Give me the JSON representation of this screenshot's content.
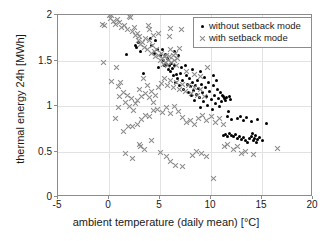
{
  "chart_data": {
    "type": "scatter",
    "title": "",
    "xlabel": "ambient temperature (daily mean) [°C]",
    "ylabel": "thermal energy 24h [MWh]",
    "xlim": [
      -5,
      20
    ],
    "ylim": [
      0,
      2
    ],
    "xticks": [
      -5,
      0,
      5,
      10,
      15,
      20
    ],
    "xticklabels": [
      "-5",
      "0",
      "5",
      "10",
      "15",
      "20"
    ],
    "yticks": [
      0,
      0.5,
      1,
      1.5,
      2
    ],
    "yticklabels": [
      "0",
      "0.5",
      "1",
      "1.5",
      "2"
    ],
    "grid": true,
    "legend_position": "top-right",
    "colors": {
      "without_setback": "#000000",
      "with_setback": "#8a8a8a",
      "axis": "#8c8c8c",
      "grid": "#e2e2e2",
      "background": "#ffffff"
    },
    "series": [
      {
        "name": "without setback mode",
        "marker": "dot",
        "color": "#000000",
        "points": [
          [
            1.7,
            1.57
          ],
          [
            2.6,
            1.66
          ],
          [
            2.7,
            1.64
          ],
          [
            2.9,
            1.7
          ],
          [
            3.1,
            1.6
          ],
          [
            3.4,
            1.36
          ],
          [
            4.2,
            1.67
          ],
          [
            4.5,
            1.58
          ],
          [
            4.8,
            1.62
          ],
          [
            5.0,
            1.55
          ],
          [
            5.2,
            1.62
          ],
          [
            5.3,
            1.5
          ],
          [
            5.5,
            1.57
          ],
          [
            5.6,
            1.46
          ],
          [
            5.7,
            1.52
          ],
          [
            5.8,
            1.4
          ],
          [
            5.9,
            1.44
          ],
          [
            6.0,
            1.38
          ],
          [
            6.1,
            1.47
          ],
          [
            6.2,
            1.41
          ],
          [
            6.3,
            1.33
          ],
          [
            6.4,
            1.44
          ],
          [
            6.5,
            1.26
          ],
          [
            6.6,
            1.35
          ],
          [
            6.7,
            1.3
          ],
          [
            6.9,
            1.22
          ],
          [
            7.0,
            1.36
          ],
          [
            7.2,
            1.28
          ],
          [
            7.3,
            1.18
          ],
          [
            7.5,
            1.45
          ],
          [
            7.6,
            1.33
          ],
          [
            7.7,
            1.24
          ],
          [
            7.8,
            1.15
          ],
          [
            7.9,
            1.3
          ],
          [
            8.0,
            1.21
          ],
          [
            8.1,
            1.11
          ],
          [
            8.2,
            1.26
          ],
          [
            8.3,
            1.17
          ],
          [
            8.4,
            1.06
          ],
          [
            8.5,
            1.22
          ],
          [
            8.6,
            1.13
          ],
          [
            8.7,
            1.28
          ],
          [
            8.8,
            1.19
          ],
          [
            8.9,
            1.09
          ],
          [
            9.0,
            0.98
          ],
          [
            9.1,
            1.24
          ],
          [
            9.2,
            1.15
          ],
          [
            9.3,
            1.05
          ],
          [
            9.4,
            1.31
          ],
          [
            9.5,
            1.2
          ],
          [
            9.6,
            1.1
          ],
          [
            9.7,
            1.01
          ],
          [
            9.8,
            1.26
          ],
          [
            9.9,
            1.16
          ],
          [
            10.0,
            1.07
          ],
          [
            10.1,
            0.96
          ],
          [
            10.2,
            1.22
          ],
          [
            10.3,
            1.12
          ],
          [
            10.4,
            1.03
          ],
          [
            10.5,
            1.28
          ],
          [
            10.6,
            1.18
          ],
          [
            10.7,
            1.08
          ],
          [
            10.8,
            0.99
          ],
          [
            10.9,
            1.15
          ],
          [
            11.0,
            1.05
          ],
          [
            11.1,
            1.12
          ],
          [
            11.2,
            1.1
          ],
          [
            11.3,
            1.08
          ],
          [
            11.4,
            1.06
          ],
          [
            11.5,
            1.09
          ],
          [
            11.6,
            0.88
          ],
          [
            11.7,
            0.94
          ],
          [
            11.8,
            1.1
          ],
          [
            11.9,
            1.07
          ],
          [
            12.0,
            0.85
          ],
          [
            11.2,
            0.68
          ],
          [
            11.4,
            0.69
          ],
          [
            11.6,
            0.67
          ],
          [
            11.8,
            0.7
          ],
          [
            12.0,
            0.68
          ],
          [
            12.2,
            0.66
          ],
          [
            12.4,
            0.69
          ],
          [
            12.6,
            0.64
          ],
          [
            12.8,
            0.66
          ],
          [
            13.0,
            0.63
          ],
          [
            13.2,
            0.65
          ],
          [
            13.4,
            0.62
          ],
          [
            13.6,
            0.6
          ],
          [
            13.8,
            0.64
          ],
          [
            14.0,
            0.66
          ],
          [
            14.1,
            0.7
          ],
          [
            14.2,
            0.62
          ],
          [
            14.3,
            0.64
          ],
          [
            14.4,
            0.68
          ],
          [
            14.5,
            0.6
          ],
          [
            14.6,
            0.63
          ],
          [
            14.8,
            0.65
          ],
          [
            15.0,
            0.62
          ],
          [
            12.6,
            0.86
          ],
          [
            12.9,
            0.88
          ],
          [
            13.2,
            0.84
          ],
          [
            13.5,
            0.87
          ],
          [
            14.0,
            0.83
          ],
          [
            14.6,
            0.85
          ],
          [
            15.4,
            0.81
          ],
          [
            10.2,
            1.34
          ],
          [
            9.0,
            1.38
          ],
          [
            8.2,
            1.4
          ],
          [
            7.1,
            1.42
          ],
          [
            6.8,
            1.56
          ],
          [
            6.4,
            1.6
          ],
          [
            5.4,
            1.44
          ],
          [
            4.9,
            1.42
          ],
          [
            4.6,
            1.72
          ],
          [
            4.1,
            1.74
          ]
        ]
      },
      {
        "name": "with setback mode",
        "marker": "x",
        "color": "#8a8a8a",
        "points": [
          [
            -0.6,
            1.9
          ],
          [
            -0.4,
            1.88
          ],
          [
            0.0,
            1.99
          ],
          [
            0.1,
            1.96
          ],
          [
            0.2,
            1.99
          ],
          [
            0.4,
            1.93
          ],
          [
            0.6,
            1.9
          ],
          [
            0.8,
            1.95
          ],
          [
            1.0,
            1.92
          ],
          [
            1.2,
            1.86
          ],
          [
            1.5,
            1.88
          ],
          [
            1.8,
            1.84
          ],
          [
            2.0,
            1.98
          ],
          [
            2.1,
            1.97
          ],
          [
            2.3,
            1.82
          ],
          [
            2.5,
            1.86
          ],
          [
            2.6,
            1.78
          ],
          [
            2.8,
            1.8
          ],
          [
            2.9,
            1.72
          ],
          [
            3.0,
            1.76
          ],
          [
            3.1,
            1.68
          ],
          [
            3.3,
            1.7
          ],
          [
            3.5,
            1.64
          ],
          [
            3.6,
            1.74
          ],
          [
            3.8,
            1.62
          ],
          [
            3.9,
            1.88
          ],
          [
            4.0,
            1.84
          ],
          [
            4.2,
            1.58
          ],
          [
            4.3,
            1.66
          ],
          [
            4.5,
            1.6
          ],
          [
            4.6,
            1.54
          ],
          [
            4.7,
            1.62
          ],
          [
            4.9,
            1.56
          ],
          [
            5.0,
            1.5
          ],
          [
            5.1,
            1.58
          ],
          [
            5.2,
            1.52
          ],
          [
            5.3,
            1.46
          ],
          [
            5.4,
            1.54
          ],
          [
            5.5,
            1.48
          ],
          [
            5.6,
            1.56
          ],
          [
            5.7,
            1.44
          ],
          [
            5.8,
            1.5
          ],
          [
            5.9,
            1.54
          ],
          [
            6.0,
            1.62
          ],
          [
            6.1,
            1.48
          ],
          [
            6.3,
            1.56
          ],
          [
            6.4,
            1.5
          ],
          [
            6.5,
            1.58
          ],
          [
            6.6,
            1.44
          ],
          [
            6.7,
            1.52
          ],
          [
            6.9,
            1.63
          ],
          [
            7.1,
            1.84
          ],
          [
            6.0,
            1.85
          ],
          [
            5.9,
            1.76
          ],
          [
            4.9,
            1.8
          ],
          [
            4.4,
            1.78
          ],
          [
            4.0,
            1.72
          ],
          [
            -0.5,
            1.48
          ],
          [
            0.7,
            1.42
          ],
          [
            0.2,
            1.27
          ],
          [
            0.9,
            1.21
          ],
          [
            1.1,
            1.26
          ],
          [
            0.9,
            0.98
          ],
          [
            1.0,
            1.1
          ],
          [
            1.4,
            1.15
          ],
          [
            1.6,
            1.04
          ],
          [
            1.8,
            1.12
          ],
          [
            2.0,
            1.0
          ],
          [
            2.2,
            1.08
          ],
          [
            2.4,
            0.95
          ],
          [
            2.6,
            1.03
          ],
          [
            2.8,
            1.06
          ],
          [
            3.0,
            1.18
          ],
          [
            3.2,
            1.1
          ],
          [
            3.4,
            1.3
          ],
          [
            3.6,
            1.14
          ],
          [
            3.8,
            1.22
          ],
          [
            4.0,
            1.09
          ],
          [
            4.2,
            1.16
          ],
          [
            4.4,
            1.04
          ],
          [
            4.6,
            1.12
          ],
          [
            4.9,
            1.2
          ],
          [
            5.1,
            1.25
          ],
          [
            5.4,
            1.3
          ],
          [
            5.7,
            1.22
          ],
          [
            6.0,
            1.28
          ],
          [
            6.3,
            1.2
          ],
          [
            6.6,
            1.26
          ],
          [
            6.9,
            1.18
          ],
          [
            7.2,
            1.24
          ],
          [
            7.5,
            1.16
          ],
          [
            7.8,
            1.22
          ],
          [
            8.1,
            1.14
          ],
          [
            8.4,
            1.2
          ],
          [
            8.7,
            1.12
          ],
          [
            9.0,
            1.18
          ],
          [
            9.4,
            1.1
          ],
          [
            9.7,
            1.42
          ],
          [
            9.0,
            1.32
          ],
          [
            8.4,
            1.35
          ],
          [
            7.6,
            1.38
          ],
          [
            0.6,
            0.86
          ],
          [
            1.4,
            0.72
          ],
          [
            1.9,
            0.78
          ],
          [
            2.3,
            0.77
          ],
          [
            2.8,
            0.8
          ],
          [
            3.2,
            0.85
          ],
          [
            3.6,
            0.9
          ],
          [
            4.0,
            0.88
          ],
          [
            4.4,
            0.95
          ],
          [
            4.8,
            0.96
          ],
          [
            5.2,
            0.93
          ],
          [
            5.6,
            0.98
          ],
          [
            6.0,
            0.92
          ],
          [
            6.4,
            1.0
          ],
          [
            6.8,
            0.94
          ],
          [
            7.2,
            0.87
          ],
          [
            7.6,
            0.82
          ],
          [
            8.0,
            0.84
          ],
          [
            8.4,
            0.8
          ],
          [
            8.8,
            0.86
          ],
          [
            9.2,
            0.9
          ],
          [
            9.6,
            0.84
          ],
          [
            10.0,
            0.88
          ],
          [
            10.4,
            0.82
          ],
          [
            10.8,
            0.86
          ],
          [
            11.2,
            0.8
          ],
          [
            1.6,
            0.48
          ],
          [
            2.3,
            0.42
          ],
          [
            3.0,
            0.58
          ],
          [
            3.1,
            0.56
          ],
          [
            3.5,
            0.52
          ],
          [
            4.2,
            0.62
          ],
          [
            5.0,
            0.49
          ],
          [
            5.6,
            0.44
          ],
          [
            6.0,
            0.39
          ],
          [
            6.5,
            0.35
          ],
          [
            7.2,
            0.34
          ],
          [
            8.2,
            0.46
          ],
          [
            8.6,
            0.5
          ],
          [
            9.1,
            0.48
          ],
          [
            9.6,
            0.44
          ],
          [
            10.2,
            0.2
          ],
          [
            11.3,
            0.56
          ],
          [
            11.6,
            0.58
          ],
          [
            12.2,
            0.52
          ],
          [
            12.6,
            0.55
          ],
          [
            13.0,
            0.48
          ],
          [
            13.4,
            0.5
          ],
          [
            14.2,
            0.47
          ],
          [
            16.5,
            0.53
          ],
          [
            13.3,
            0.0
          ],
          [
            14.3,
            0.0
          ]
        ]
      }
    ]
  },
  "legend": {
    "items": [
      {
        "label": "without setback mode",
        "marker": "dot"
      },
      {
        "label": "with setback mode",
        "marker": "cross"
      }
    ]
  }
}
